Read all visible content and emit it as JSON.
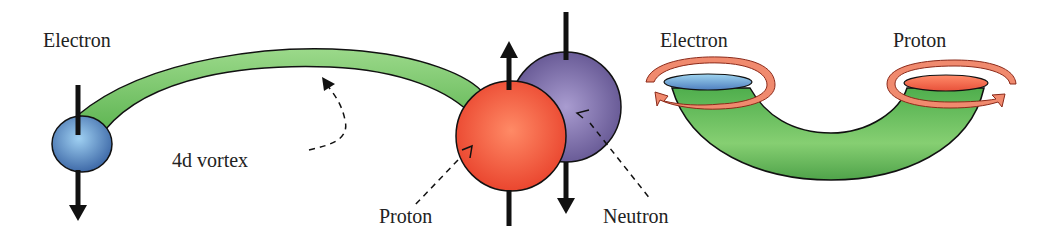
{
  "left_diagram": {
    "labels": {
      "electron": "Electron",
      "vortex": "4d vortex",
      "proton": "Proton",
      "neutron": "Neutron"
    }
  },
  "right_diagram": {
    "labels": {
      "electron": "Electron",
      "proton": "Proton"
    }
  },
  "colors": {
    "electron": "#5b8fc9",
    "proton": "#f0563a",
    "neutron": "#7a6aa8",
    "vortex": "#7cc86a",
    "spin_ring": "#f08a6e",
    "outline": "#111111"
  }
}
